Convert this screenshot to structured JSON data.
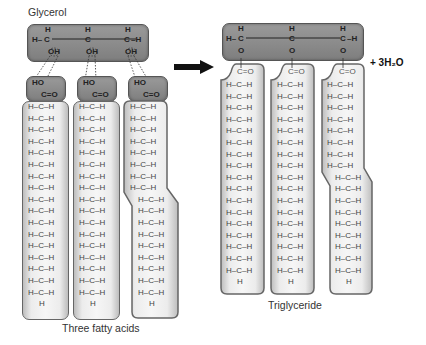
{
  "labels": {
    "glycerol": "Glycerol",
    "fatty_acids": "Three fatty acids",
    "triglyceride": "Triglyceride",
    "water": "+ 3H₂O"
  },
  "atoms": {
    "H": "H",
    "C": "C",
    "O": "O",
    "OH": "OH",
    "HO": "HO",
    "CO": "C=O",
    "HCH": "H–C–H",
    "H_dash": "H–",
    "dash_H": "–H"
  },
  "colors": {
    "dark_box": "#8a8a8a",
    "light_box": "#efefef",
    "border": "#555555",
    "arrow": "#111111"
  },
  "left": {
    "chain_rows": 17,
    "unsaturated_kink_after_row": 7
  },
  "right": {
    "chain_rows": 17,
    "unsaturated_kink_after_row": 7
  }
}
